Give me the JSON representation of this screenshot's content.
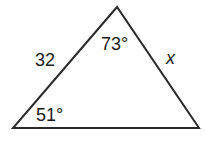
{
  "diagram": {
    "type": "triangle",
    "stroke_color": "#2a2a2a",
    "background": "#ffffff",
    "vertices": {
      "top": [
        117,
        7
      ],
      "bottom_left": [
        13,
        128
      ],
      "bottom_right": [
        199,
        128
      ]
    },
    "labels": {
      "left_side": "32",
      "right_side": "x",
      "top_angle": "73°",
      "bottom_left_angle": "51°"
    }
  }
}
